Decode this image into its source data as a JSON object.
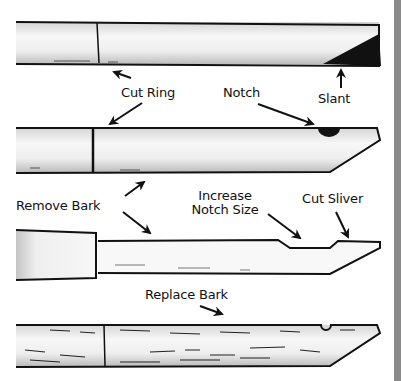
{
  "figure": {
    "type": "instructional-diagram",
    "stages": [
      {
        "step": 1,
        "name": "stick-with-slant"
      },
      {
        "step": 2,
        "name": "stick-with-ring-and-notch"
      },
      {
        "step": 3,
        "name": "bark-removed-stick"
      },
      {
        "step": 4,
        "name": "bark-replaced-stick"
      }
    ]
  },
  "labels": {
    "cut_ring": "Cut Ring",
    "notch": "Notch",
    "slant": "Slant",
    "remove_bark": "Remove Bark",
    "increase_notch_line1": "Increase",
    "increase_notch_line2": "Notch Size",
    "cut_sliver": "Cut Sliver",
    "replace_bark": "Replace Bark"
  },
  "colors": {
    "ink": "#111111",
    "wood_light": "#f4f4f4",
    "wood_shade": "#c8c8c8",
    "edge_bar": "#8a8a8a"
  }
}
